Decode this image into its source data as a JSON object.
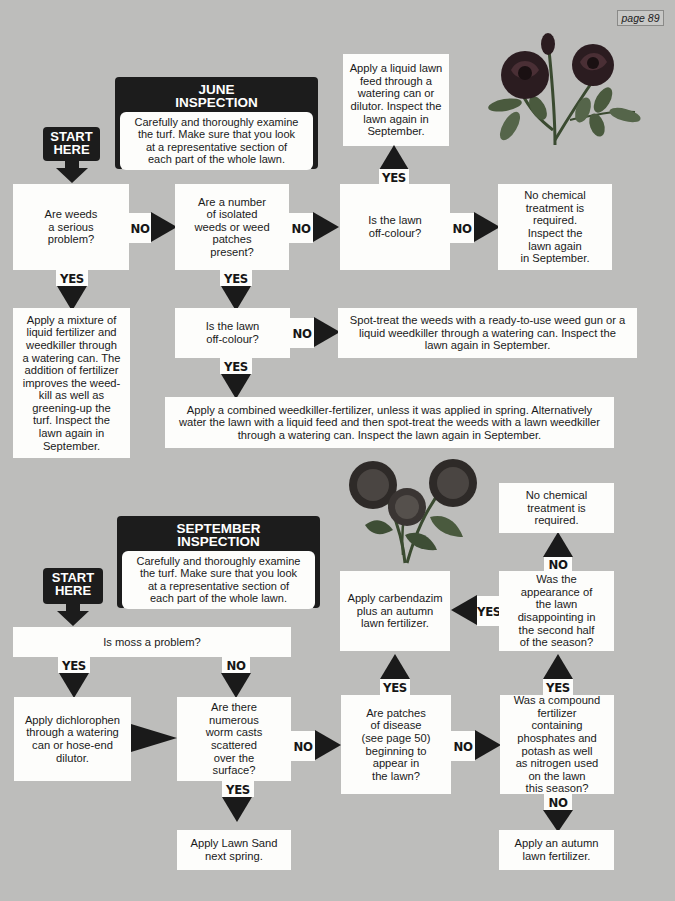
{
  "page_tag": "page 89",
  "colors": {
    "background": "#bdbdbb",
    "box": "#fdfdfb",
    "dark": "#1c1c1c"
  },
  "june": {
    "header_title": "JUNE\nINSPECTION",
    "header_text": "Carefully and thoroughly examine\nthe turf. Make sure that you look\nat a representative section of\neach part of the whole lawn.",
    "start": "START\nHERE",
    "q_weeds_serious": "Are weeds\na serious\nproblem?",
    "q_isolated_weeds": "Are a number\nof isolated\nweeds or weed\npatches\npresent?",
    "q_off_colour_1": "Is the lawn\noff-colour?",
    "no_chemical": "No chemical\ntreatment is\nrequired.\nInspect the\nlawn again\nin September.",
    "liquid_feed": "Apply a liquid lawn\nfeed through a\nwatering can or\ndilutor. Inspect the\nlawn again in\nSeptember.",
    "mixture": "Apply a mixture of\nliquid fertilizer and\nweedkiller through\na watering can. The\naddition of fertilizer\nimproves the weed-\nkill as well as\ngreening-up the\nturf. Inspect the\nlawn again in\nSeptember.",
    "q_off_colour_2": "Is the lawn\noff-colour?",
    "spot_treat": "Spot-treat the weeds with a ready-to-use weed gun or a\nliquid weedkiller through a watering can. Inspect the\nlawn again in September.",
    "combined": "Apply a combined weedkiller-fertilizer, unless it was applied in spring. Alternatively\nwater the lawn with a liquid feed and then spot-treat the weeds with a lawn weedkiller\nthrough a watering can. Inspect the lawn again in September."
  },
  "september": {
    "header_title": "SEPTEMBER\nINSPECTION",
    "header_text": "Carefully and thoroughly examine\nthe turf. Make sure that you look\nat a representative section of\neach part of the whole lawn.",
    "start": "START\nHERE",
    "q_moss": "Is moss a problem?",
    "dichlorophen": "Apply dichlorophen\nthrough a watering\ncan or hose-end\ndilutor.",
    "q_worm_casts": "Are there\nnumerous\nworm casts\nscattered\nover the\nsurface?",
    "lawn_sand": "Apply Lawn Sand\nnext spring.",
    "q_disease": "Are patches\nof disease\n(see page 50)\nbeginning to\nappear in\nthe lawn?",
    "carbendazim": "Apply carbendazim\nplus an autumn\nlawn fertilizer.",
    "q_compound": "Was a compound\nfertilizer\ncontaining\nphosphates and\npotash as well\nas nitrogen used\non the lawn\nthis season?",
    "q_disappointing": "Was the\nappearance of\nthe lawn\ndisappointing in\nthe second half\nof the season?",
    "no_chemical": "No chemical\ntreatment is\nrequired.",
    "autumn_fertilizer": "Apply an autumn\nlawn fertilizer."
  },
  "labels": {
    "yes": "YES",
    "no": "NO"
  },
  "illustrations": [
    "roses-illustration",
    "chrysanthemums-illustration"
  ]
}
